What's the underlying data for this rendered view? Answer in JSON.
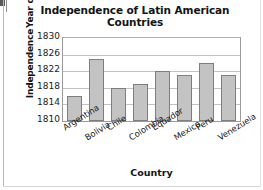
{
  "chart_data": {
    "type": "bar",
    "title": "Independence of Latin American Countries",
    "title_line1": "Independence of Latin American",
    "title_line2": "Countries",
    "xlabel": "Country",
    "ylabel": "Year of Independence",
    "ylabel_line1": "Year of",
    "ylabel_line2": "Independence",
    "categories": [
      "Argentina",
      "Bolivia",
      "Chile",
      "Colombia",
      "Equador",
      "Mexico",
      "Peru",
      "Venezuela"
    ],
    "values": [
      1816,
      1825,
      1818,
      1819,
      1822,
      1821,
      1824,
      1821
    ],
    "ylim": [
      1810,
      1830
    ],
    "yticks": [
      1810,
      1814,
      1818,
      1822,
      1826,
      1830
    ],
    "ytick_labels": [
      "1810",
      "1814",
      "1818",
      "1822",
      "1826",
      "1830"
    ],
    "grid": true,
    "grid_axis": "y",
    "legend": false,
    "bar_color": "#c3c3c3",
    "bar_edge_color": "#7e7e7e",
    "axis_color": "#9a9a9a",
    "grid_color": "#c2c2c2",
    "text_color": "#141414"
  }
}
